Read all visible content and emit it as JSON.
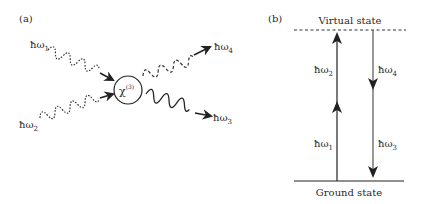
{
  "panel_a": {
    "label": "(a)",
    "chi_symbol": "χ",
    "chi_order": "(3)",
    "photons": [
      {
        "id": "w1",
        "label_base": "ħω",
        "label_sub": "1",
        "style": "dotted",
        "direction": "in"
      },
      {
        "id": "w2",
        "label_base": "ħω",
        "label_sub": "2",
        "style": "dotted",
        "direction": "in"
      },
      {
        "id": "w4",
        "label_base": "ħω",
        "label_sub": "4",
        "style": "dashed",
        "direction": "out"
      },
      {
        "id": "w3",
        "label_base": "ħω",
        "label_sub": "3",
        "style": "solid",
        "direction": "out"
      }
    ]
  },
  "panel_b": {
    "label": "(b)",
    "top_level": "Virtual state",
    "bottom_level": "Ground state",
    "up_transitions": [
      {
        "label_base": "ħω",
        "label_sub": "2"
      },
      {
        "label_base": "ħω",
        "label_sub": "1"
      }
    ],
    "down_transitions": [
      {
        "label_base": "ħω",
        "label_sub": "4"
      },
      {
        "label_base": "ħω",
        "label_sub": "3"
      }
    ]
  },
  "colors": {
    "ink": "#2a2a2a",
    "gray_arrow": "#555555",
    "background": "#ffffff"
  }
}
